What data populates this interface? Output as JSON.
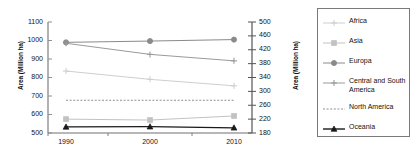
{
  "chart_data": {
    "type": "line",
    "title": "",
    "xlabel": "",
    "ylabel": "Area (Million ha)",
    "ylabel_right": "Area (Million ha)",
    "x": [
      "1990",
      "2000",
      "2010"
    ],
    "ylim": [
      500,
      1100
    ],
    "yticks": [
      "500",
      "600",
      "700",
      "800",
      "900",
      "1000",
      "1100"
    ],
    "ylim_right": [
      180,
      500
    ],
    "yticks_right": [
      "180",
      "220",
      "260",
      "300",
      "340",
      "380",
      "420",
      "460",
      "500"
    ],
    "grid": false,
    "legend_position": "right",
    "series": [
      {
        "name": "Africa",
        "values": [
          835,
          790,
          755
        ],
        "color": "#cfcfcf",
        "marker": "plus",
        "dash": "none"
      },
      {
        "name": "Asia",
        "values": [
          575,
          570,
          592
        ],
        "color": "#c2c2c2",
        "marker": "square",
        "dash": "none"
      },
      {
        "name": "Europa",
        "values": [
          990,
          997,
          1005
        ],
        "color": "#8a8a8a",
        "marker": "circle",
        "dash": "none"
      },
      {
        "name": "Central and South America",
        "values": [
          985,
          925,
          890
        ],
        "color": "#9a9a9a",
        "marker": "plus",
        "dash": "none"
      },
      {
        "name": "North America",
        "values": [
          677,
          677,
          677
        ],
        "color": "#8f8f8f",
        "marker": "none",
        "dash": "dotted"
      },
      {
        "name": "Oceania",
        "values": [
          533,
          534,
          528
        ],
        "color": "#1a1a1a",
        "marker": "triangle",
        "dash": "none"
      }
    ]
  },
  "axes": {
    "left": {
      "title": "Area (Million ha)",
      "ticks": [
        "1100",
        "1000",
        "900",
        "800",
        "700",
        "600",
        "500"
      ]
    },
    "right": {
      "title": "Area (Million ha)",
      "ticks": [
        "500",
        "460",
        "420",
        "380",
        "340",
        "300",
        "260",
        "220",
        "180"
      ]
    },
    "x": {
      "ticks": [
        "1990",
        "2000",
        "2010"
      ]
    }
  },
  "legend": {
    "items": [
      {
        "label": "Africa"
      },
      {
        "label": "Asia"
      },
      {
        "label": "Europa"
      },
      {
        "label": "Central and South America"
      },
      {
        "label": "North America"
      },
      {
        "label": "Oceania"
      }
    ]
  }
}
